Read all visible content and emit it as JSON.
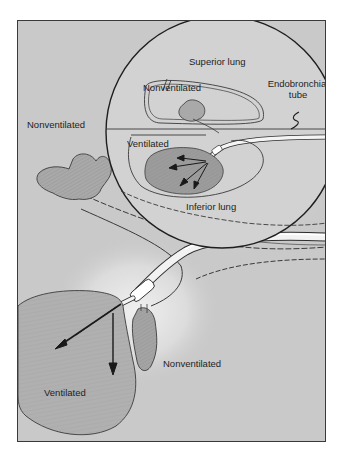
{
  "figure": {
    "type": "medical-illustration",
    "inset_labels": {
      "superior_lung": "Superior lung",
      "nonventilated": "Nonventilated",
      "ventilated": "Ventilated",
      "inferior_lung": "Inferior lung",
      "endobronchial_tube_line1": "Endobronchial",
      "endobronchial_tube_line2": "tube"
    },
    "main_labels": {
      "nonventilated_upper": "Nonventilated",
      "nonventilated_lower": "Nonventilated",
      "ventilated_lower": "Ventilated"
    },
    "colors": {
      "background": "#c9c9c9",
      "highlight_glow": "#ececec",
      "lung_fill": "#a9a9a9",
      "outline": "#2a2a2a",
      "tube_fill": "#f2f2f2",
      "frame_border": "#3a3a3a"
    }
  }
}
